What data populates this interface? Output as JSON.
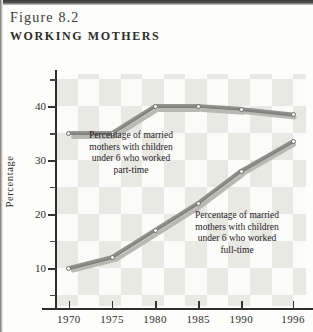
{
  "figure": {
    "number_label": "Figure 8.2",
    "title": "WORKING MOTHERS"
  },
  "chart_data": {
    "type": "line",
    "title": "Working Mothers",
    "xlabel": "",
    "ylabel": "Percentage",
    "x": [
      1970,
      1975,
      1980,
      1985,
      1990,
      1996
    ],
    "xtick_labels": [
      "1970",
      "1975",
      "1980",
      "1985",
      "1990",
      "1996"
    ],
    "ytick_labels": [
      "10",
      "20",
      "30",
      "40"
    ],
    "ytick_values": [
      10,
      20,
      30,
      40
    ],
    "yminor_values": [
      5,
      15,
      25,
      35,
      45
    ],
    "ylim": [
      3,
      46
    ],
    "xlim": [
      1968.5,
      1997.5
    ],
    "grid": "checkerboard",
    "legend": "annotations",
    "series": [
      {
        "name": "part-time",
        "label": "Percentage of married mothers with children under 6 who worked part-time",
        "values": [
          35,
          35,
          40,
          40,
          39.5,
          38.5
        ]
      },
      {
        "name": "full-time",
        "label": "Percentage of married mothers with children under 6 who worked full-time",
        "values": [
          10,
          12,
          17,
          22,
          28,
          33.5
        ]
      }
    ],
    "annotations": [
      {
        "id": "part-time",
        "lines": [
          "Percentage of married",
          "mothers with children",
          "under 6 who worked",
          "part-time"
        ]
      },
      {
        "id": "full-time",
        "lines": [
          "Percentage of married",
          "mothers with children",
          "under 6 who worked",
          "full-time"
        ]
      }
    ],
    "colors": {
      "line_top": "#8d8d88",
      "line_shadow": "#b9b9b4",
      "axis": "#2f2e2c",
      "checker_cell": "#e9e9e4",
      "plot_background": "#fbfbf9",
      "text": "#2e2d2b"
    }
  }
}
